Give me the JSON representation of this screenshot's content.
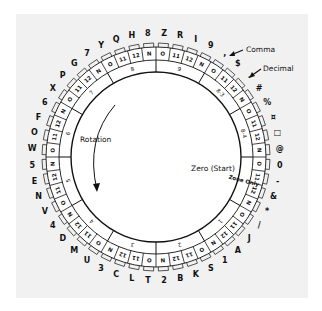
{
  "diagram": {
    "center": {
      "x": 156,
      "y": 157
    },
    "radii": {
      "inner": 85,
      "groupOuter": 97,
      "cellOuter": 110,
      "tabOuter": 114,
      "labelR": 124
    },
    "cells_clockwise_from_top": [
      "O",
      "11",
      "12",
      "N",
      "O",
      "11",
      "12",
      "N",
      "O",
      "11",
      "12",
      "N",
      "O",
      "11",
      "12",
      "N",
      "O",
      "11",
      "12",
      "N",
      "O",
      "11",
      "12",
      "N",
      "O",
      "11",
      "12",
      "N",
      "O",
      "11",
      "12",
      "N",
      "O",
      "11",
      "12",
      "N",
      "O",
      "11",
      "12",
      "N",
      "O",
      "11",
      "12",
      "N",
      "O",
      "11",
      "12",
      "N"
    ],
    "outer_chars_clockwise_from_top": [
      "Z",
      "R",
      "I",
      "9",
      ",",
      "$",
      ".",
      "#",
      "%",
      "¤",
      "□",
      "@",
      "0",
      "-",
      "&",
      "*",
      "/",
      "J",
      "A",
      "1",
      "S",
      "K",
      "B",
      "2",
      "T",
      "L",
      "C",
      "3",
      "U",
      "M",
      "D",
      "4",
      "V",
      "N",
      "E",
      "5",
      "W",
      "O",
      "F",
      "6",
      "X",
      "P",
      "G",
      "7",
      "Y",
      "Q",
      "H",
      "8"
    ],
    "groups_clockwise_from_top": [
      "9",
      "8-3",
      "8-4",
      "Zone Only",
      "1",
      "2",
      "3",
      "4",
      "5",
      "6",
      "7",
      "8"
    ],
    "labels": {
      "rotation": "Rotation",
      "zero_start": "Zero (Start)",
      "comma": "Comma",
      "decimal": "Decimal",
      "zone_only": "Zone Only"
    }
  }
}
